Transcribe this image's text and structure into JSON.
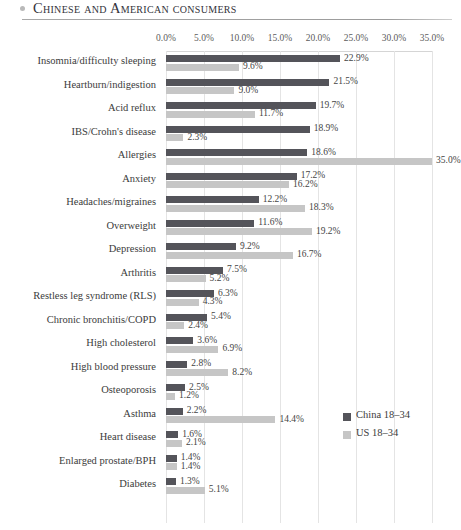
{
  "header": {
    "title": "Chinese and American consumers",
    "bullet_icon": "bullet-dot"
  },
  "legend": {
    "position": "inside-right",
    "items": [
      {
        "label": "China 18–34",
        "color": "#54545a"
      },
      {
        "label": "US 18–34",
        "color": "#c6c6c6"
      }
    ]
  },
  "chart_data": {
    "type": "bar",
    "orientation": "horizontal",
    "title": "Chinese and American consumers",
    "xlabel": "",
    "ylabel": "",
    "xlim": [
      0,
      35
    ],
    "grid": true,
    "tick_labels": [
      "0.0%",
      "5.0%",
      "10.0%",
      "15.0%",
      "20.0%",
      "25.0%",
      "30.0%",
      "35.0%"
    ],
    "tick_values": [
      0,
      5,
      10,
      15,
      20,
      25,
      30,
      35
    ],
    "categories": [
      "Insomnia/difficulty sleeping",
      "Heartburn/indigestion",
      "Acid reflux",
      "IBS/Crohn's disease",
      "Allergies",
      "Anxiety",
      "Headaches/migraines",
      "Overweight",
      "Depression",
      "Arthritis",
      "Restless leg syndrome (RLS)",
      "Chronic bronchitis/COPD",
      "High cholesterol",
      "High blood pressure",
      "Osteoporosis",
      "Asthma",
      "Heart disease",
      "Enlarged prostate/BPH",
      "Diabetes"
    ],
    "series": [
      {
        "name": "China 18–34",
        "color": "#54545a",
        "values": [
          22.9,
          21.5,
          19.7,
          18.9,
          18.6,
          17.2,
          12.2,
          11.6,
          9.2,
          7.5,
          6.3,
          5.4,
          3.6,
          2.8,
          2.5,
          2.2,
          1.6,
          1.4,
          1.3
        ],
        "labels": [
          "22.9%",
          "21.5%",
          "19.7%",
          "18.9%",
          "18.6%",
          "17.2%",
          "12.2%",
          "11.6%",
          "9.2%",
          "7.5%",
          "6.3%",
          "5.4%",
          "3.6%",
          "2.8%",
          "2.5%",
          "2.2%",
          "1.6%",
          "1.4%",
          "1.3%"
        ]
      },
      {
        "name": "US 18–34",
        "color": "#c6c6c6",
        "values": [
          9.6,
          9.0,
          11.7,
          2.3,
          35.0,
          16.2,
          18.3,
          19.2,
          16.7,
          5.2,
          4.3,
          2.4,
          6.9,
          8.2,
          1.2,
          14.4,
          2.1,
          1.4,
          5.1
        ],
        "labels": [
          "9.6%",
          "9.0%",
          "11.7%",
          "2.3%",
          "35.0%",
          "16.2%",
          "18.3%",
          "19.2%",
          "16.7%",
          "5.2%",
          "4.3%",
          "2.4%",
          "6.9%",
          "8.2%",
          "1.2%",
          "14.4%",
          "2.1%",
          "1.4%",
          "5.1%"
        ]
      }
    ]
  }
}
